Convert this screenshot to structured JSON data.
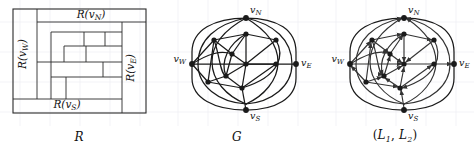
{
  "figure": {
    "title_not_shown": "",
    "background_color": "#ffffff",
    "line_color": "#1a1a1a",
    "grid_color": "#e2e2ea",
    "node_color": "#1a1a1a",
    "panel_count": 3
  },
  "panels": [
    {
      "id": "rectangular-dissection",
      "caption": "R",
      "caption_parts": {
        "main": "R",
        "sub": ""
      },
      "labels": {
        "north": "R(vN)",
        "north_base": "R(v",
        "north_sub": "N",
        "south": "R(vS)",
        "south_base": "R(v",
        "south_sub": "S",
        "west": "R(vW)",
        "west_base": "R(v",
        "west_sub": "W",
        "east": "R(vE)",
        "east_base": "R(v",
        "east_sub": "E"
      }
    },
    {
      "id": "plane-graph",
      "caption": "G",
      "caption_parts": {
        "main": "G",
        "sub": ""
      },
      "labels": {
        "north": "vN",
        "north_base": "v",
        "north_sub": "N",
        "south": "vS",
        "south_base": "v",
        "south_sub": "S",
        "west": "vW",
        "west_base": "v",
        "west_sub": "W",
        "east": "vE",
        "east_base": "v",
        "east_sub": "E"
      }
    },
    {
      "id": "orientation-pair",
      "caption": "(L1, L2)",
      "caption_parts": {
        "open": "(",
        "l1": "L",
        "l1_sub": "1",
        "comma": ", ",
        "l2": "L",
        "l2_sub": "2",
        "close": ")"
      },
      "labels": {
        "north": "vN",
        "north_base": "v",
        "north_sub": "N",
        "south": "vS",
        "south_base": "v",
        "south_sub": "S",
        "west": "vW",
        "west_base": "v",
        "west_sub": "W",
        "east": "vE",
        "east_base": "v",
        "east_sub": "E"
      }
    }
  ]
}
